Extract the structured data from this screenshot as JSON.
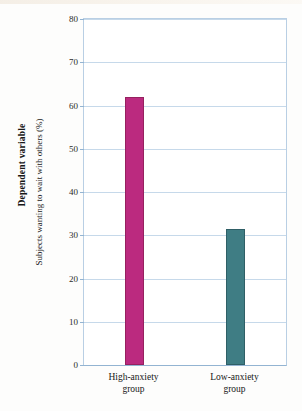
{
  "figure": {
    "outer_label": "Dependent variable",
    "background_color": "#fdfdfc"
  },
  "chart_data": {
    "type": "bar",
    "title": "",
    "subtitle": "",
    "xlabel": "",
    "ylabel": "Subjects wanting to wait with others (%)",
    "categories": [
      "High-anxiety group",
      "Low-anxiety group"
    ],
    "category_lines": [
      [
        "High-anxiety",
        "group"
      ],
      [
        "Low-anxiety",
        "group"
      ]
    ],
    "values": [
      62,
      31.5
    ],
    "ylim": [
      0,
      80
    ],
    "yticks": [
      80,
      70,
      60,
      50,
      40,
      30,
      20,
      10,
      0
    ],
    "ytick_labels": [
      "80",
      "70",
      "60",
      "50",
      "40",
      "30",
      "20",
      "10",
      "0"
    ],
    "grid": true,
    "grid_axis": "y",
    "grid_color": "#c6d9ea",
    "axis_color": "#93b4d2",
    "legend": false,
    "legend_position": "none",
    "bar_colors": [
      "#bb2a7f",
      "#3f7d84"
    ],
    "bar_edge_colors": [
      "#96215f",
      "#2f5f66"
    ],
    "series": [
      {
        "name": "Subjects wanting to wait with others (%)",
        "values": [
          62,
          31.5
        ]
      }
    ]
  }
}
